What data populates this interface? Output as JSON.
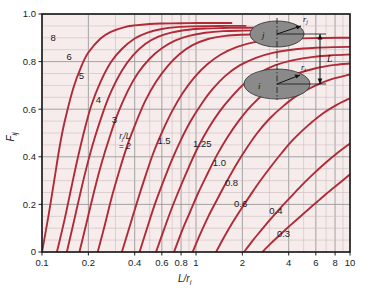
{
  "chart_data": {
    "type": "line",
    "title": "",
    "xlabel": "L/r_i",
    "ylabel": "F_ij",
    "xscale": "log",
    "xlim": [
      0.1,
      10
    ],
    "ylim": [
      0.0,
      1.0
    ],
    "grid": true,
    "legend_position": "inline-curve-labels",
    "x_ticks": [
      "0.1",
      "0.2",
      "0.4",
      "0.6",
      "0.8",
      "1",
      "2",
      "4",
      "6",
      "8",
      "10"
    ],
    "x_tick_values": [
      0.1,
      0.2,
      0.4,
      0.6,
      0.8,
      1,
      2,
      4,
      6,
      8,
      10
    ],
    "y_ticks": [
      "0",
      "0.2",
      "0.4",
      "0.6",
      "0.8",
      "1.0"
    ],
    "y_tick_values": [
      0,
      0.2,
      0.4,
      0.6,
      0.8,
      1.0
    ],
    "series_parameter_name": "r_j/L",
    "series": [
      {
        "name": "8",
        "label": "8",
        "x": [
          0.1,
          0.11,
          0.12,
          0.13,
          0.14,
          0.16,
          0.18,
          0.2,
          0.24,
          0.28,
          0.34,
          0.4,
          0.5,
          0.6,
          0.8,
          1.0,
          1.3,
          1.7
        ],
        "values": [
          0.0,
          0.15,
          0.3,
          0.44,
          0.545,
          0.69,
          0.78,
          0.838,
          0.897,
          0.925,
          0.944,
          0.952,
          0.958,
          0.96,
          0.961,
          0.962,
          0.962,
          0.962
        ]
      },
      {
        "name": "6",
        "label": "6",
        "x": [
          0.125,
          0.14,
          0.155,
          0.17,
          0.19,
          0.21,
          0.24,
          0.28,
          0.33,
          0.4,
          0.48,
          0.6,
          0.75,
          0.95,
          1.2,
          1.6,
          2.1
        ],
        "values": [
          0.0,
          0.135,
          0.27,
          0.39,
          0.52,
          0.62,
          0.715,
          0.797,
          0.853,
          0.897,
          0.921,
          0.937,
          0.945,
          0.948,
          0.949,
          0.95,
          0.95
        ]
      },
      {
        "name": "5",
        "label": "5",
        "x": [
          0.145,
          0.16,
          0.18,
          0.2,
          0.22,
          0.25,
          0.28,
          0.33,
          0.39,
          0.47,
          0.57,
          0.7,
          0.9,
          1.15,
          1.5,
          2.0,
          2.4
        ],
        "values": [
          0.0,
          0.12,
          0.265,
          0.385,
          0.48,
          0.59,
          0.672,
          0.762,
          0.826,
          0.875,
          0.905,
          0.923,
          0.934,
          0.939,
          0.941,
          0.942,
          0.942
        ]
      },
      {
        "name": "4",
        "label": "4",
        "x": [
          0.175,
          0.195,
          0.22,
          0.245,
          0.275,
          0.31,
          0.36,
          0.42,
          0.5,
          0.6,
          0.73,
          0.9,
          1.15,
          1.5,
          2.0,
          2.6,
          3.2
        ],
        "values": [
          0.0,
          0.125,
          0.265,
          0.378,
          0.483,
          0.58,
          0.676,
          0.752,
          0.812,
          0.856,
          0.888,
          0.908,
          0.921,
          0.928,
          0.93,
          0.931,
          0.931
        ]
      },
      {
        "name": "3",
        "label": "3",
        "x": [
          0.23,
          0.255,
          0.285,
          0.32,
          0.36,
          0.41,
          0.47,
          0.55,
          0.65,
          0.78,
          0.95,
          1.2,
          1.55,
          2.0,
          2.7,
          3.6,
          4.6
        ],
        "values": [
          0.0,
          0.11,
          0.235,
          0.348,
          0.452,
          0.548,
          0.637,
          0.715,
          0.779,
          0.831,
          0.869,
          0.895,
          0.908,
          0.913,
          0.915,
          0.915,
          0.915
        ]
      },
      {
        "name": "2",
        "label": "= 2",
        "x": [
          0.33,
          0.37,
          0.42,
          0.47,
          0.53,
          0.61,
          0.7,
          0.82,
          0.97,
          1.18,
          1.45,
          1.85,
          2.4,
          3.2,
          4.4,
          6.2,
          8.5,
          10.0
        ],
        "values": [
          0.0,
          0.105,
          0.222,
          0.32,
          0.418,
          0.512,
          0.592,
          0.668,
          0.732,
          0.788,
          0.83,
          0.862,
          0.882,
          0.892,
          0.897,
          0.899,
          0.9,
          0.9
        ]
      },
      {
        "name": "1.5",
        "label": "1.5",
        "x": [
          0.43,
          0.48,
          0.54,
          0.61,
          0.69,
          0.79,
          0.92,
          1.08,
          1.28,
          1.55,
          1.92,
          2.45,
          3.2,
          4.3,
          6.0,
          8.2,
          10.0
        ],
        "values": [
          0.0,
          0.098,
          0.2,
          0.292,
          0.38,
          0.465,
          0.548,
          0.62,
          0.684,
          0.74,
          0.784,
          0.816,
          0.838,
          0.851,
          0.858,
          0.861,
          0.862
        ]
      },
      {
        "name": "1.25",
        "label": "1.25",
        "x": [
          0.55,
          0.62,
          0.7,
          0.79,
          0.9,
          1.03,
          1.2,
          1.42,
          1.7,
          2.05,
          2.55,
          3.25,
          4.3,
          5.8,
          7.8,
          10.0
        ],
        "values": [
          0.0,
          0.095,
          0.188,
          0.272,
          0.358,
          0.44,
          0.518,
          0.59,
          0.652,
          0.706,
          0.75,
          0.784,
          0.806,
          0.82,
          0.827,
          0.83
        ]
      },
      {
        "name": "1.0",
        "label": "1.0",
        "x": [
          0.72,
          0.81,
          0.92,
          1.04,
          1.19,
          1.37,
          1.6,
          1.9,
          2.28,
          2.8,
          3.5,
          4.5,
          6.0,
          8.0,
          10.0
        ],
        "values": [
          0.0,
          0.088,
          0.172,
          0.252,
          0.33,
          0.408,
          0.482,
          0.552,
          0.614,
          0.668,
          0.712,
          0.748,
          0.772,
          0.786,
          0.792
        ]
      },
      {
        "name": "0.8",
        "label": "0.8",
        "x": [
          0.95,
          1.07,
          1.21,
          1.38,
          1.58,
          1.82,
          2.12,
          2.5,
          3.0,
          3.7,
          4.6,
          5.9,
          7.6,
          10.0
        ],
        "values": [
          0.0,
          0.078,
          0.153,
          0.224,
          0.295,
          0.366,
          0.434,
          0.5,
          0.56,
          0.614,
          0.66,
          0.698,
          0.726,
          0.746
        ]
      },
      {
        "name": "0.6",
        "label": "0.6",
        "x": [
          1.35,
          1.52,
          1.72,
          1.96,
          2.25,
          2.6,
          3.05,
          3.6,
          4.3,
          5.3,
          6.6,
          8.2,
          10.0
        ],
        "values": [
          0.0,
          0.062,
          0.122,
          0.18,
          0.238,
          0.297,
          0.357,
          0.416,
          0.474,
          0.53,
          0.58,
          0.618,
          0.646
        ]
      },
      {
        "name": "0.4",
        "label": "0.4",
        "x": [
          2.05,
          2.32,
          2.64,
          3.02,
          3.48,
          4.05,
          4.75,
          5.65,
          6.8,
          8.2,
          10.0
        ],
        "values": [
          0.0,
          0.046,
          0.09,
          0.135,
          0.18,
          0.226,
          0.274,
          0.322,
          0.37,
          0.414,
          0.456
        ]
      },
      {
        "name": "0.3",
        "label": "0.3",
        "x": [
          2.7,
          3.05,
          3.48,
          4.0,
          4.62,
          5.38,
          6.3,
          7.45,
          8.8,
          10.0
        ],
        "values": [
          0.0,
          0.035,
          0.07,
          0.106,
          0.142,
          0.18,
          0.218,
          0.258,
          0.296,
          0.326
        ]
      }
    ],
    "curve_label_positions": [
      {
        "label": "8",
        "x": 0.118,
        "y": 0.885
      },
      {
        "label": "6",
        "x": 0.15,
        "y": 0.805
      },
      {
        "label": "5",
        "x": 0.18,
        "y": 0.728
      },
      {
        "label": "4",
        "x": 0.232,
        "y": 0.628
      },
      {
        "label": "3",
        "x": 0.295,
        "y": 0.54
      },
      {
        "label": "1.5",
        "x": 0.62,
        "y": 0.452
      },
      {
        "label": "1.25",
        "x": 1.1,
        "y": 0.44
      },
      {
        "label": "1.0",
        "x": 1.42,
        "y": 0.362
      },
      {
        "label": "0.8",
        "x": 1.7,
        "y": 0.277
      },
      {
        "label": "0.6",
        "x": 1.95,
        "y": 0.19
      },
      {
        "label": "0.4",
        "x": 3.3,
        "y": 0.158
      },
      {
        "label": "0.3",
        "x": 3.7,
        "y": 0.062
      }
    ],
    "annotations": [
      {
        "name": "parameter-label",
        "line1": "r_j/L",
        "line2": "= 2"
      }
    ]
  },
  "axes": {
    "x_title": "L/r",
    "x_title_sub": "i",
    "y_title": "F",
    "y_title_sub": "ij"
  },
  "inset": {
    "disk_top_label": "j",
    "disk_bottom_label": "i",
    "radius_top_label": "r",
    "radius_top_sub": "j",
    "radius_bottom_label": "r",
    "radius_bottom_sub": "i",
    "separation_label": "L"
  },
  "colors": {
    "curve": "#b02a37",
    "plot_background": "#f7ecec",
    "grid_major": "#9a9a9a",
    "grid_minor": "#c9bcbc",
    "frame": "#1a1a1a",
    "inset_disk_fill": "#8a8a8a",
    "inset_bg": "#f7ecec",
    "text": "#1a1a1a"
  }
}
